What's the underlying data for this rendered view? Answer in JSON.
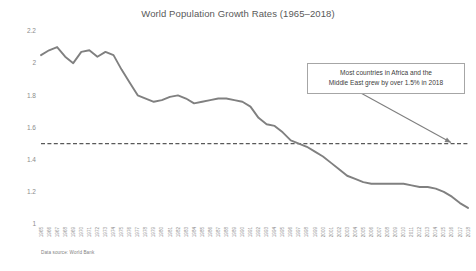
{
  "chart_data": {
    "type": "line",
    "title": "World Population Growth Rates (1965–2018)",
    "xlabel": "",
    "ylabel": "",
    "ylim": [
      1,
      2.2
    ],
    "yticks": [
      1,
      1.2,
      1.4,
      1.6,
      1.8,
      2,
      2.2
    ],
    "ytick_labels": [
      "1",
      "1.2",
      "1.4",
      "1.6",
      "1.8",
      "2",
      "2.2"
    ],
    "grid": false,
    "legend": "none",
    "series": [
      {
        "name": "World population growth rate (%)",
        "color": "#808080",
        "values": [
          2.05,
          2.08,
          2.1,
          2.04,
          2.0,
          2.07,
          2.08,
          2.04,
          2.07,
          2.05,
          1.96,
          1.88,
          1.8,
          1.78,
          1.76,
          1.77,
          1.79,
          1.8,
          1.78,
          1.75,
          1.76,
          1.77,
          1.78,
          1.78,
          1.77,
          1.76,
          1.73,
          1.66,
          1.62,
          1.61,
          1.57,
          1.52,
          1.5,
          1.48,
          1.45,
          1.42,
          1.38,
          1.34,
          1.3,
          1.28,
          1.26,
          1.25,
          1.25,
          1.25,
          1.25,
          1.25,
          1.24,
          1.23,
          1.23,
          1.22,
          1.2,
          1.17,
          1.13,
          1.1
        ]
      }
    ],
    "categories": [
      "1965",
      "1966",
      "1967",
      "1968",
      "1969",
      "1970",
      "1971",
      "1972",
      "1973",
      "1974",
      "1975",
      "1976",
      "1977",
      "1978",
      "1979",
      "1980",
      "1981",
      "1982",
      "1983",
      "1984",
      "1985",
      "1986",
      "1987",
      "1988",
      "1989",
      "1990",
      "1991",
      "1992",
      "1993",
      "1994",
      "1995",
      "1996",
      "1997",
      "1998",
      "1999",
      "2000",
      "2001",
      "2002",
      "2003",
      "2004",
      "2005",
      "2006",
      "2007",
      "2008",
      "2009",
      "2010",
      "2011",
      "2012",
      "2013",
      "2014",
      "2015",
      "2016",
      "2017",
      "2018"
    ],
    "reference_line": {
      "value": 1.5,
      "style": "dashed",
      "color": "#595959"
    },
    "annotations": [
      {
        "text": "Most countries in Africa and the Middle East grew by over 1.5% in 2018",
        "line1": "Most countries in Africa and the",
        "line2": "Middle East grew by over 1.5% in 2018",
        "arrow_to_value": 1.5
      }
    ],
    "source_note": "Data source: World Bank"
  }
}
